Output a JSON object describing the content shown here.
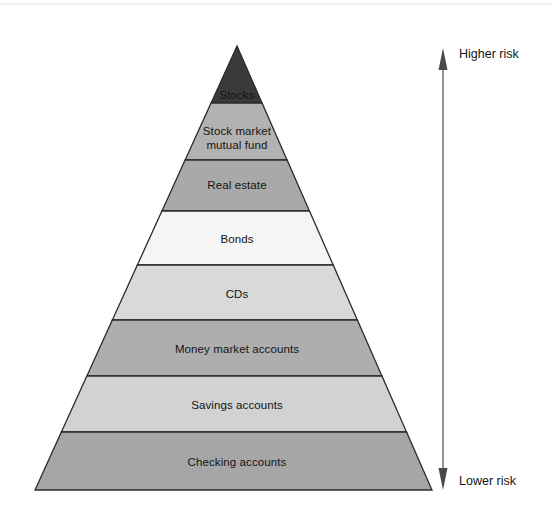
{
  "figure": {
    "type": "pyramid-diagram",
    "background_color": "#ffffff",
    "width": 552,
    "height": 526
  },
  "chart_data": {
    "type": "pyramid",
    "title": "",
    "orientation": "vertical",
    "apex": {
      "x": 237,
      "y": 46
    },
    "base": {
      "left_x": 35,
      "right_x": 432,
      "y": 490
    },
    "outline_color": "#2b2b2b",
    "tiers": [
      {
        "rank": 1,
        "label": "Stocks",
        "risk": "highest",
        "fill": "#3a3a3a",
        "top_y": 46,
        "bottom_y": 103,
        "label_y": 88,
        "label_color": "#141414"
      },
      {
        "rank": 2,
        "label": "Stock market\nmutual fund",
        "risk": "very high",
        "fill": "#b2b2b2",
        "top_y": 103,
        "bottom_y": 160,
        "label_y": 124,
        "label_color": "#141414"
      },
      {
        "rank": 3,
        "label": "Real estate",
        "risk": "high",
        "fill": "#a9a9a9",
        "top_y": 160,
        "bottom_y": 211,
        "label_y": 178,
        "label_color": "#141414"
      },
      {
        "rank": 4,
        "label": "Bonds",
        "risk": "moderate",
        "fill": "#f5f5f5",
        "top_y": 211,
        "bottom_y": 265,
        "label_y": 232,
        "label_color": "#141414"
      },
      {
        "rank": 5,
        "label": "CDs",
        "risk": "low-moderate",
        "fill": "#d9d9d9",
        "top_y": 265,
        "bottom_y": 320,
        "label_y": 287,
        "label_color": "#141414"
      },
      {
        "rank": 6,
        "label": "Money market accounts",
        "risk": "low",
        "fill": "#aeaeae",
        "top_y": 320,
        "bottom_y": 376,
        "label_y": 342,
        "label_color": "#141414"
      },
      {
        "rank": 7,
        "label": "Savings accounts",
        "risk": "very low",
        "fill": "#d2d2d2",
        "top_y": 376,
        "bottom_y": 432,
        "label_y": 398,
        "label_color": "#141414"
      },
      {
        "rank": 8,
        "label": "Checking accounts",
        "risk": "lowest",
        "fill": "#a6a6a6",
        "top_y": 432,
        "bottom_y": 490,
        "label_y": 455,
        "label_color": "#141414"
      }
    ],
    "axis": {
      "kind": "double-headed-arrow",
      "x": 443,
      "top_y": 48,
      "bottom_y": 490,
      "color": "#4a4a4a",
      "top_label": "Higher risk",
      "bottom_label": "Lower risk",
      "top_label_x": 459,
      "top_label_y": 47,
      "bottom_label_x": 459,
      "bottom_label_y": 474
    }
  }
}
